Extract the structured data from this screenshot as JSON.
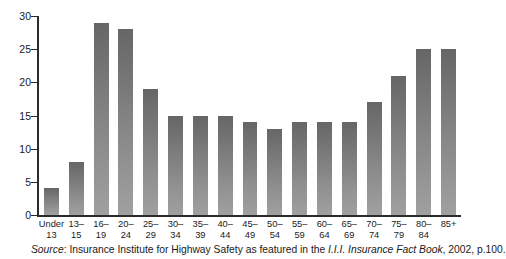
{
  "chart_data": {
    "type": "bar",
    "title": "",
    "subtitle": "",
    "xlabel": "",
    "ylabel": "",
    "ylim": [
      0,
      30
    ],
    "ytick_values": [
      0,
      5,
      10,
      15,
      20,
      25,
      30
    ],
    "ytick_labels": [
      "0",
      "5",
      "10",
      "15",
      "20",
      "25",
      "30"
    ],
    "grid": false,
    "legend": null,
    "categories": [
      "Under 13",
      "13-15",
      "16-19",
      "20-24",
      "25-29",
      "30-34",
      "35-39",
      "40-44",
      "45-49",
      "50-54",
      "55-59",
      "60-64",
      "65-69",
      "70-74",
      "75-79",
      "80-84",
      "85+"
    ],
    "category_lines": [
      [
        "Under",
        "13"
      ],
      [
        "13–",
        "15"
      ],
      [
        "16–",
        "19"
      ],
      [
        "20–",
        "24"
      ],
      [
        "25–",
        "29"
      ],
      [
        "30–",
        "34"
      ],
      [
        "35–",
        "39"
      ],
      [
        "40–",
        "44"
      ],
      [
        "45–",
        "49"
      ],
      [
        "50–",
        "54"
      ],
      [
        "55–",
        "59"
      ],
      [
        "60–",
        "64"
      ],
      [
        "65–",
        "69"
      ],
      [
        "70–",
        "74"
      ],
      [
        "75–",
        "79"
      ],
      [
        "80–",
        "84"
      ],
      [
        "85+",
        ""
      ]
    ],
    "values": [
      4,
      8,
      29,
      28,
      19,
      15,
      15,
      15,
      14,
      13,
      14,
      14,
      14,
      17,
      21,
      25,
      25
    ],
    "bar_color_top": "#666666",
    "bar_color_bottom": "#a0a0a0",
    "axis_color": "#2b2b2b"
  },
  "source": {
    "label": "Source",
    "separator": ": ",
    "text_before": "Insurance Institute for Highway Safety as featured in the ",
    "italic_title": "I.I.I. Insurance Fact Book",
    "text_after": ", 2002, p.100."
  }
}
